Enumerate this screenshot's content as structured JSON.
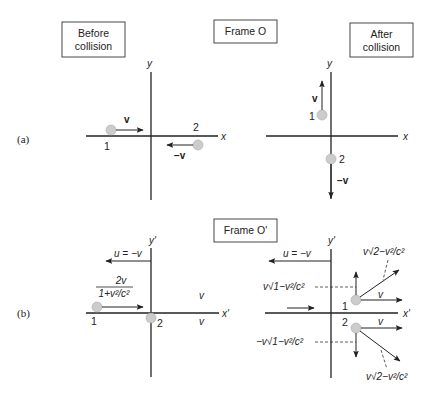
{
  "panel_a": {
    "label": "(a)",
    "frame_label": "Frame O",
    "before_label_line1": "Before",
    "before_label_line2": "collision",
    "after_label_line1": "After",
    "after_label_line2": "collision",
    "axis_x": "x",
    "axis_y": "y",
    "before": {
      "ball1_label": "1",
      "ball1_velocity": "v",
      "ball2_label": "2",
      "ball2_velocity": "−v"
    },
    "after": {
      "ball1_label": "1",
      "ball1_velocity": "v",
      "ball2_label": "2",
      "ball2_velocity": "−v"
    }
  },
  "panel_b": {
    "label": "(b)",
    "frame_label": "Frame O'",
    "axis_x": "x'",
    "axis_y": "y'",
    "before": {
      "frame_velocity": "u = −v",
      "ball1_speed_num": "2v",
      "ball1_speed_den": "1+v²/c²",
      "ball1_label": "1",
      "ball2_label": "2",
      "v_upper": "v",
      "v_lower": "v"
    },
    "after": {
      "frame_velocity": "u = −v",
      "ball1_label": "1",
      "ball2_label": "2",
      "vy1": "v√1−v²/c²",
      "vy2": "−v√1−v²/c²",
      "vx1": "v",
      "vx2": "v",
      "speed_top": "v√2−v²/c²",
      "speed_bottom": "v√2−v²/c²"
    }
  }
}
